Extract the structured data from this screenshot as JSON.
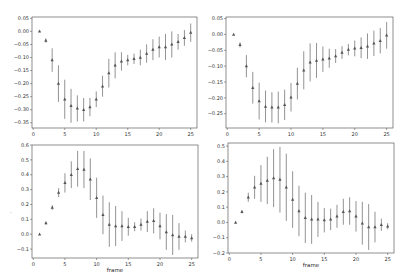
{
  "figure": {
    "width": 408,
    "height": 280,
    "marker_color": "#555555",
    "errorbar_color": "#777777",
    "stray_mark": "."
  },
  "chart_data": [
    {
      "type": "scatter",
      "subtype": "errorbar",
      "position": "top-left",
      "title": "",
      "xlabel": "",
      "ylabel": "",
      "xlim": [
        -0.2,
        26
      ],
      "ylim": [
        -0.37,
        0.055
      ],
      "xticks": [
        0,
        5,
        10,
        15,
        20,
        25
      ],
      "yticks": [
        0.05,
        0.0,
        -0.05,
        -0.1,
        -0.15,
        -0.2,
        -0.25,
        -0.3,
        -0.35
      ],
      "ytick_labels": [
        "0.05",
        "0.00",
        "−0.05",
        "−0.10",
        "−0.15",
        "−0.20",
        "−0.25",
        "−0.30",
        "−0.35"
      ],
      "grid": false,
      "marker": "triangle",
      "x": [
        1,
        2,
        3,
        4,
        5,
        6,
        7,
        8,
        9,
        10,
        11,
        12,
        13,
        14,
        15,
        16,
        17,
        18,
        19,
        20,
        21,
        22,
        23,
        24,
        25
      ],
      "y": [
        0.0,
        -0.035,
        -0.11,
        -0.2,
        -0.26,
        -0.285,
        -0.295,
        -0.3,
        -0.29,
        -0.26,
        -0.21,
        -0.16,
        -0.13,
        -0.115,
        -0.11,
        -0.105,
        -0.1,
        -0.085,
        -0.07,
        -0.06,
        -0.06,
        -0.05,
        -0.04,
        -0.025,
        -0.005
      ],
      "yerr": [
        0.0,
        0.008,
        0.045,
        0.07,
        0.075,
        0.065,
        0.05,
        0.045,
        0.035,
        0.03,
        0.04,
        0.055,
        0.05,
        0.035,
        0.02,
        0.02,
        0.03,
        0.035,
        0.04,
        0.04,
        0.05,
        0.05,
        0.03,
        0.03,
        0.035
      ]
    },
    {
      "type": "scatter",
      "subtype": "errorbar",
      "position": "top-right",
      "title": "",
      "xlabel": "",
      "ylabel": "",
      "xlim": [
        -0.2,
        26
      ],
      "ylim": [
        -0.295,
        0.055
      ],
      "xticks": [
        0,
        5,
        10,
        15,
        20,
        25
      ],
      "yticks": [
        0.05,
        0.0,
        -0.05,
        -0.1,
        -0.15,
        -0.2,
        -0.25
      ],
      "ytick_labels": [
        "0.05",
        "0.00",
        "−0.05",
        "−0.10",
        "−0.15",
        "−0.20",
        "−0.25"
      ],
      "grid": false,
      "marker": "triangle",
      "x": [
        1,
        2,
        3,
        4,
        5,
        6,
        7,
        8,
        9,
        10,
        11,
        12,
        13,
        14,
        15,
        16,
        17,
        18,
        19,
        20,
        21,
        22,
        23,
        24,
        25
      ],
      "y": [
        0.0,
        -0.033,
        -0.1,
        -0.168,
        -0.21,
        -0.227,
        -0.23,
        -0.23,
        -0.222,
        -0.198,
        -0.155,
        -0.113,
        -0.088,
        -0.082,
        -0.078,
        -0.075,
        -0.068,
        -0.057,
        -0.048,
        -0.044,
        -0.042,
        -0.037,
        -0.028,
        -0.02,
        -0.003
      ],
      "yerr": [
        0.0,
        0.008,
        0.035,
        0.05,
        0.058,
        0.05,
        0.048,
        0.05,
        0.048,
        0.045,
        0.05,
        0.06,
        0.06,
        0.055,
        0.04,
        0.03,
        0.022,
        0.02,
        0.018,
        0.025,
        0.033,
        0.04,
        0.04,
        0.04,
        0.042
      ]
    },
    {
      "type": "scatter",
      "subtype": "errorbar",
      "position": "bottom-left",
      "title": "",
      "xlabel": "frame",
      "ylabel": "",
      "xlim": [
        -0.2,
        26
      ],
      "ylim": [
        -0.16,
        0.6
      ],
      "xticks": [
        0,
        5,
        10,
        15,
        20,
        25
      ],
      "yticks": [
        0.6,
        0.5,
        0.4,
        0.3,
        0.2,
        0.1,
        0.0,
        -0.1
      ],
      "ytick_labels": [
        "0.6",
        "0.5",
        "0.4",
        "0.3",
        "0.2",
        "0.1",
        "0.0",
        "−0.1"
      ],
      "grid": false,
      "marker": "triangle",
      "x": [
        1,
        2,
        3,
        4,
        5,
        6,
        7,
        8,
        9,
        10,
        11,
        12,
        13,
        14,
        15,
        16,
        17,
        18,
        19,
        20,
        21,
        22,
        23,
        24,
        25
      ],
      "y": [
        0.0,
        0.075,
        0.18,
        0.28,
        0.345,
        0.4,
        0.44,
        0.435,
        0.37,
        0.245,
        0.13,
        0.065,
        0.055,
        0.055,
        0.05,
        0.05,
        0.065,
        0.085,
        0.09,
        0.055,
        0.015,
        -0.005,
        -0.015,
        -0.015,
        -0.025
      ],
      "yerr": [
        0.0,
        0.01,
        0.015,
        0.03,
        0.065,
        0.09,
        0.12,
        0.125,
        0.14,
        0.135,
        0.13,
        0.15,
        0.135,
        0.1,
        0.06,
        0.03,
        0.04,
        0.07,
        0.085,
        0.09,
        0.12,
        0.135,
        0.09,
        0.04,
        0.025
      ]
    },
    {
      "type": "scatter",
      "subtype": "errorbar",
      "position": "bottom-right",
      "title": "",
      "xlabel": "frame",
      "ylabel": "",
      "xlim": [
        -0.2,
        26
      ],
      "ylim": [
        -0.2,
        0.52
      ],
      "xticks": [
        0,
        5,
        10,
        15,
        20,
        25
      ],
      "yticks": [
        0.5,
        0.4,
        0.3,
        0.2,
        0.1,
        0.0,
        -0.1,
        -0.2
      ],
      "ytick_labels": [
        "0.5",
        "0.4",
        "0.3",
        "0.2",
        "0.1",
        "0.0",
        "−0.1",
        "−0.2"
      ],
      "grid": false,
      "marker": "triangle",
      "x": [
        1,
        2,
        3,
        4,
        5,
        6,
        7,
        8,
        9,
        10,
        11,
        12,
        13,
        14,
        15,
        16,
        17,
        18,
        19,
        20,
        21,
        22,
        23,
        24,
        25
      ],
      "y": [
        0.0,
        0.07,
        0.165,
        0.23,
        0.255,
        0.275,
        0.29,
        0.28,
        0.23,
        0.15,
        0.075,
        0.03,
        0.02,
        0.02,
        0.015,
        0.02,
        0.04,
        0.07,
        0.075,
        0.04,
        -0.005,
        -0.03,
        -0.03,
        -0.015,
        -0.025
      ],
      "yerr": [
        0.0,
        0.01,
        0.03,
        0.075,
        0.12,
        0.155,
        0.19,
        0.215,
        0.22,
        0.185,
        0.165,
        0.165,
        0.16,
        0.115,
        0.08,
        0.07,
        0.075,
        0.085,
        0.09,
        0.1,
        0.14,
        0.15,
        0.1,
        0.04,
        0.02
      ]
    }
  ]
}
